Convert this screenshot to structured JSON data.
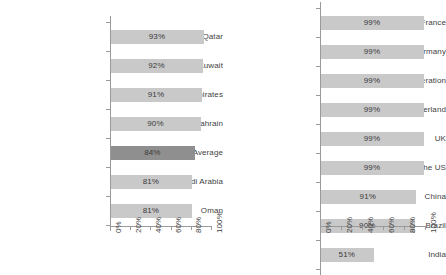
{
  "chart_data": [
    {
      "id": "gcc-internet-penetration",
      "type": "bar",
      "orientation": "horizontal",
      "title": "",
      "xlabel": "",
      "ylabel": "",
      "xlim": [
        0,
        100
      ],
      "grid": false,
      "legend": null,
      "axis_tick_labels": [
        "0%",
        "20%",
        "40%",
        "60%",
        "80%",
        "100%"
      ],
      "axis_tick_values": [
        0,
        20,
        40,
        60,
        80,
        100
      ],
      "categories": [
        "Qatar",
        "Kuwait",
        "United Arab Emirates",
        "Bahrain",
        "GCC Average",
        "Saudi Arabia",
        "Oman"
      ],
      "values": [
        93,
        92,
        91,
        90,
        84,
        81,
        81
      ],
      "value_labels": [
        "93%",
        "92%",
        "91%",
        "90%",
        "84%",
        "81%",
        "81%"
      ],
      "highlight_index": 4,
      "bar_color": "#c9c9c9",
      "highlight_color": "#8f8f8f"
    },
    {
      "id": "world-internet-penetration",
      "type": "bar",
      "orientation": "horizontal",
      "title": "",
      "xlabel": "",
      "ylabel": "",
      "xlim": [
        0,
        100
      ],
      "grid": false,
      "legend": null,
      "axis_tick_labels": [
        "0%",
        "20%",
        "40%",
        "60%",
        "80%",
        "100%"
      ],
      "axis_tick_values": [
        0,
        20,
        40,
        60,
        80,
        100
      ],
      "categories": [
        "France",
        "Germany",
        "Russian Federation",
        "Switzerland",
        "UK",
        "The US",
        "China",
        "Brazil",
        "India"
      ],
      "values": [
        99,
        99,
        99,
        99,
        99,
        99,
        91,
        90,
        51
      ],
      "value_labels": [
        "99%",
        "99%",
        "99%",
        "99%",
        "99%",
        "99%",
        "91%",
        "90%",
        "51%"
      ],
      "highlight_index": -1,
      "bar_color": "#c9c9c9",
      "highlight_color": "#8f8f8f"
    }
  ]
}
